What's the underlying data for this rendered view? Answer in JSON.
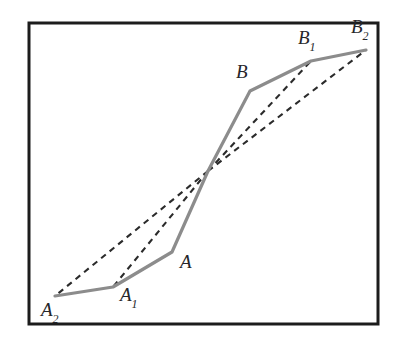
{
  "figure": {
    "background_color": "#ffffff",
    "frame": {
      "name": "figure-border",
      "x": 29,
      "y": 23,
      "width": 349,
      "height": 301,
      "stroke_color": "#1c1c1c",
      "stroke_width": 3
    },
    "solid_curve": {
      "name": "solid-polyline",
      "stroke_color": "#8c8c8c",
      "stroke_width": 3.2,
      "style": "solid",
      "points": [
        {
          "label": "A2",
          "x": 55,
          "y": 296
        },
        {
          "label": "A1",
          "x": 113,
          "y": 287
        },
        {
          "label": "A",
          "x": 172,
          "y": 252
        },
        {
          "label": "crossing",
          "x": 208,
          "y": 171
        },
        {
          "label": "B",
          "x": 250,
          "y": 91
        },
        {
          "label": "B1",
          "x": 311,
          "y": 61
        },
        {
          "label": "B2",
          "x": 366,
          "y": 50
        }
      ]
    },
    "dashed_lines": {
      "name": "dashed-chords",
      "stroke_color": "#2b2b2b",
      "stroke_width": 2.1,
      "dash_pattern": "6 5",
      "origin": {
        "x": 208,
        "y": 171
      },
      "segments": [
        {
          "name": "dash-to-A2",
          "to_label": "A2",
          "x": 55,
          "y": 296
        },
        {
          "name": "dash-to-A1",
          "to_label": "A1",
          "x": 113,
          "y": 287
        },
        {
          "name": "dash-to-B1",
          "to_label": "B1",
          "x": 311,
          "y": 61
        },
        {
          "name": "dash-to-B2",
          "to_label": "B2",
          "x": 366,
          "y": 50
        }
      ]
    },
    "labels": [
      {
        "name": "label-A2",
        "base": "A",
        "sub": "2",
        "x": 41,
        "y": 300
      },
      {
        "name": "label-A1",
        "base": "A",
        "sub": "1",
        "x": 120,
        "y": 285
      },
      {
        "name": "label-A",
        "base": "A",
        "sub": "",
        "x": 180,
        "y": 252
      },
      {
        "name": "label-B",
        "base": "B",
        "sub": "",
        "x": 236,
        "y": 62
      },
      {
        "name": "label-B1",
        "base": "B",
        "sub": "1",
        "x": 298,
        "y": 28
      },
      {
        "name": "label-B2",
        "base": "B",
        "sub": "2",
        "x": 351,
        "y": 17
      }
    ]
  }
}
